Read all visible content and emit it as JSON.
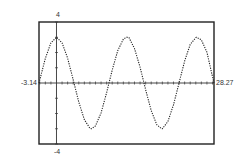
{
  "chart_data": {
    "type": "line",
    "title": "",
    "xlabel": "",
    "ylabel": "",
    "xlim": [
      -3.14,
      28.27
    ],
    "ylim": [
      -4,
      4
    ],
    "x_tick_step": 1,
    "y_tick_step": 1,
    "grid": false,
    "legend": null,
    "tick_labels": {
      "xmin": "-3.14",
      "xmax": "28.27",
      "ymin": "-4",
      "ymax": "4"
    },
    "series": [
      {
        "name": "y = 3cos(x/2)",
        "style": "dotted",
        "color": "#222222",
        "x": [
          -3.14,
          -2,
          -1,
          0,
          1,
          2,
          3,
          4,
          5,
          6,
          6.28,
          7,
          8,
          9,
          10,
          11,
          12,
          12.57,
          13,
          14,
          15,
          16,
          17,
          18,
          18.85,
          19,
          20,
          21,
          22,
          23,
          24,
          25,
          25.13,
          26,
          27,
          28,
          28.27
        ],
        "y": [
          0.0,
          1.62,
          2.63,
          3.0,
          2.63,
          1.62,
          0.21,
          -1.25,
          -2.4,
          -2.97,
          -3.0,
          -2.81,
          -1.96,
          -0.63,
          0.85,
          2.13,
          2.88,
          3.0,
          2.98,
          2.26,
          1.04,
          -0.44,
          -1.81,
          -2.73,
          -3.0,
          -3.0,
          -2.52,
          -1.43,
          0.01,
          1.44,
          2.53,
          2.97,
          3.0,
          2.83,
          2.02,
          0.41,
          0.0
        ]
      }
    ],
    "axis_color": "#333333",
    "frame_color": "#222222"
  }
}
